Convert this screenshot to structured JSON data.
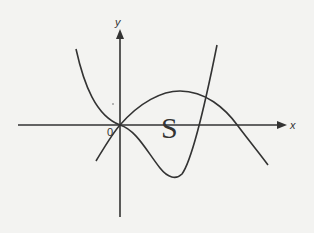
{
  "diagram": {
    "type": "function-graph",
    "colors": {
      "background": "#f3f3f1",
      "stroke": "#333333"
    },
    "axes": {
      "x_label": "x",
      "y_label": "y",
      "origin_label": "0"
    },
    "curves": [
      {
        "name": "quartic-like curve",
        "description": "W-shaped curve tangent at origin, dips to a minimum below the x-axis, then rises steeply"
      },
      {
        "name": "downward parabola",
        "description": "Passes through origin, peaks above the x-axis, crosses x-axis on right"
      }
    ],
    "region": {
      "label": "S",
      "description": "Enclosed area between the two curves"
    }
  }
}
